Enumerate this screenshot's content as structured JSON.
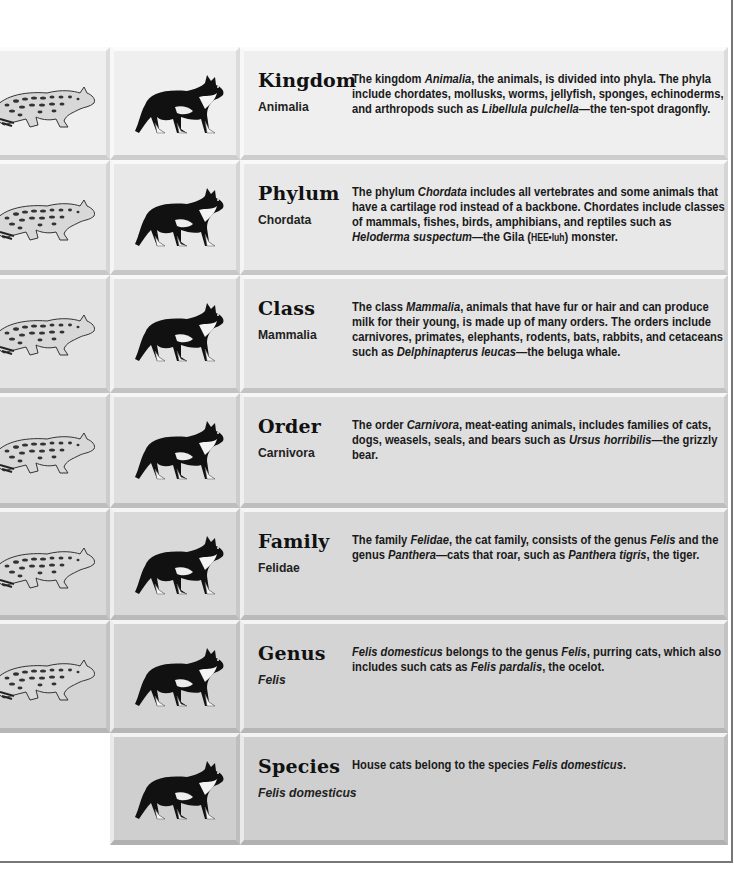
{
  "rows": [
    {
      "rank": "Kingdom",
      "taxon": "Animalia",
      "taxon_italic": false,
      "has_ocelot": true,
      "bg": "#efefef",
      "description_parts": [
        {
          "t": "The kingdom "
        },
        {
          "t": "Animalia",
          "i": true
        },
        {
          "t": ", the animals, is divided into phyla. The phyla include chordates, mollusks, worms, jellyfish, sponges, echinoderms, and arthropods such as "
        },
        {
          "t": "Libellula pulchella",
          "i": true
        },
        {
          "t": "—the ten-spot dragonfly."
        }
      ]
    },
    {
      "rank": "Phylum",
      "taxon": "Chordata",
      "taxon_italic": false,
      "has_ocelot": true,
      "bg": "#e8e8e8",
      "description_parts": [
        {
          "t": "The phylum "
        },
        {
          "t": "Chordata",
          "i": true
        },
        {
          "t": " includes all vertebrates and some animals that have a cartilage rod instead of a backbone. Chordates include classes of mammals, fishes, birds, amphibians, and reptiles such as "
        },
        {
          "t": "Heloderma suspectum",
          "i": true
        },
        {
          "t": "—the Gila ("
        },
        {
          "t": "HEE•luh",
          "sc": true
        },
        {
          "t": ") monster."
        }
      ]
    },
    {
      "rank": "Class",
      "taxon": "Mammalia",
      "taxon_italic": false,
      "has_ocelot": true,
      "bg": "#e3e3e3",
      "description_parts": [
        {
          "t": "The class "
        },
        {
          "t": "Mammalia",
          "i": true
        },
        {
          "t": ", animals that have fur or hair and can produce milk for their young, is made up of many orders. The orders include carnivores, primates, elephants, rodents, bats, rabbits, and cetaceans such as "
        },
        {
          "t": "Delphinapterus leucas",
          "i": true
        },
        {
          "t": "—the beluga whale."
        }
      ]
    },
    {
      "rank": "Order",
      "taxon": "Carnivora",
      "taxon_italic": false,
      "has_ocelot": true,
      "bg": "#dedede",
      "description_parts": [
        {
          "t": "The order "
        },
        {
          "t": "Carnivora",
          "i": true
        },
        {
          "t": ", meat-eating animals, includes families of cats, dogs, weasels, seals, and bears such as "
        },
        {
          "t": "Ursus horribilis",
          "i": true
        },
        {
          "t": "—the grizzly bear."
        }
      ]
    },
    {
      "rank": "Family",
      "taxon": "Felidae",
      "taxon_italic": false,
      "has_ocelot": true,
      "bg": "#d9d9d9",
      "description_parts": [
        {
          "t": "The family "
        },
        {
          "t": "Felidae",
          "i": true
        },
        {
          "t": ", the cat family, consists of the genus "
        },
        {
          "t": "Felis",
          "i": true
        },
        {
          "t": " and the genus "
        },
        {
          "t": "Panthera",
          "i": true
        },
        {
          "t": "—cats that roar, such as "
        },
        {
          "t": "Panthera tigris",
          "i": true
        },
        {
          "t": ", the tiger."
        }
      ]
    },
    {
      "rank": "Genus",
      "taxon": "Felis",
      "taxon_italic": true,
      "has_ocelot": true,
      "bg": "#d4d4d4",
      "description_parts": [
        {
          "t": "Felis domesticus",
          "i": true
        },
        {
          "t": " belongs to the genus "
        },
        {
          "t": "Felis",
          "i": true
        },
        {
          "t": ", purring cats, which also includes such cats as "
        },
        {
          "t": "Felis pardalis",
          "i": true
        },
        {
          "t": ", the ocelot."
        }
      ]
    },
    {
      "rank": "Species",
      "taxon": "Felis domesticus",
      "taxon_italic": true,
      "has_ocelot": false,
      "bg": "#cfcfcf",
      "description_parts": [
        {
          "t": "House cats belong to the species "
        },
        {
          "t": "Felis domesticus",
          "i": true
        },
        {
          "t": "."
        }
      ]
    }
  ],
  "row_tops": [
    0,
    113,
    228,
    346,
    461,
    573,
    686
  ],
  "row_heights": [
    113,
    115,
    118,
    115,
    112,
    113,
    112
  ],
  "icons": {
    "ocelot": "ocelot-illustration",
    "cat": "house-cat-illustration"
  }
}
